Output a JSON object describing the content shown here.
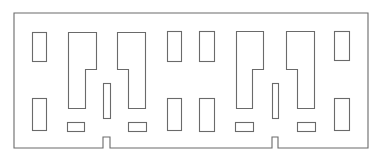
{
  "diagram": {
    "type": "floor-plan-outline",
    "canvas": {
      "width": 381,
      "height": 162
    },
    "colors": {
      "background": "#ffffff",
      "line": "#6a6a6a"
    },
    "outer_wall": {
      "points": [
        [
          14,
          13
        ],
        [
          368,
          13
        ],
        [
          368,
          148
        ],
        [
          278,
          148
        ],
        [
          278,
          137
        ],
        [
          272,
          137
        ],
        [
          272,
          148
        ],
        [
          110,
          148
        ],
        [
          110,
          137
        ],
        [
          103,
          137
        ],
        [
          103,
          148
        ],
        [
          14,
          148
        ]
      ]
    },
    "rects": [
      {
        "name": "room-left-top",
        "x": 32,
        "y": 32,
        "w": 14,
        "h": 29
      },
      {
        "name": "room-left-bottom",
        "x": 32,
        "y": 98,
        "w": 14,
        "h": 32
      },
      {
        "name": "slot-a-bottom",
        "x": 67,
        "y": 122,
        "w": 17,
        "h": 9
      },
      {
        "name": "column-a",
        "x": 103,
        "y": 83,
        "w": 7,
        "h": 35
      },
      {
        "name": "slot-b-bottom",
        "x": 128,
        "y": 122,
        "w": 18,
        "h": 9
      },
      {
        "name": "room-center-left-top",
        "x": 167,
        "y": 31,
        "w": 14,
        "h": 30
      },
      {
        "name": "room-center-left-bottom",
        "x": 167,
        "y": 98,
        "w": 14,
        "h": 32
      },
      {
        "name": "room-center-right-top",
        "x": 199,
        "y": 31,
        "w": 15,
        "h": 30
      },
      {
        "name": "room-center-right-bottom",
        "x": 199,
        "y": 98,
        "w": 15,
        "h": 33
      },
      {
        "name": "slot-c-bottom",
        "x": 235,
        "y": 122,
        "w": 18,
        "h": 9
      },
      {
        "name": "column-b",
        "x": 272,
        "y": 83,
        "w": 6,
        "h": 35
      },
      {
        "name": "slot-d-bottom",
        "x": 297,
        "y": 122,
        "w": 18,
        "h": 9
      },
      {
        "name": "room-right-top",
        "x": 334,
        "y": 31,
        "w": 15,
        "h": 29
      },
      {
        "name": "room-right-bottom",
        "x": 334,
        "y": 98,
        "w": 15,
        "h": 32
      }
    ],
    "l_shapes": [
      {
        "name": "l-room-1",
        "points": [
          [
            68,
            32
          ],
          [
            96,
            32
          ],
          [
            96,
            69
          ],
          [
            85,
            69
          ],
          [
            85,
            108
          ],
          [
            68,
            108
          ]
        ]
      },
      {
        "name": "l-room-2",
        "points": [
          [
            117,
            32
          ],
          [
            145,
            32
          ],
          [
            145,
            108
          ],
          [
            128,
            108
          ],
          [
            128,
            69
          ],
          [
            117,
            69
          ]
        ]
      },
      {
        "name": "l-room-3",
        "points": [
          [
            236,
            31
          ],
          [
            263,
            31
          ],
          [
            263,
            69
          ],
          [
            252,
            69
          ],
          [
            252,
            108
          ],
          [
            236,
            108
          ]
        ]
      },
      {
        "name": "l-room-4",
        "points": [
          [
            286,
            31
          ],
          [
            314,
            31
          ],
          [
            314,
            108
          ],
          [
            297,
            108
          ],
          [
            297,
            69
          ],
          [
            286,
            69
          ]
        ]
      }
    ]
  }
}
